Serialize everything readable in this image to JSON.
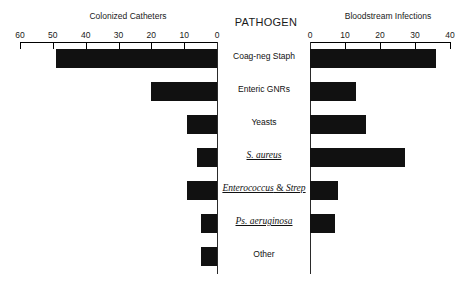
{
  "chart_data": {
    "type": "bar",
    "subtype": "back-to-back-tornado",
    "title": "",
    "center_header": "PATHOGEN",
    "categories": [
      "Coag-neg Staph",
      "Enteric GNRs",
      "Yeasts",
      "S. aureus",
      "Enterococcus & Strep",
      "Ps. aeruginosa",
      "Other"
    ],
    "series": [
      {
        "name": "Colonized Catheters",
        "side": "left",
        "values": [
          49,
          20,
          9,
          6,
          9,
          5,
          5
        ],
        "axis": {
          "label": "Colonized Catheters",
          "ticks": [
            60,
            50,
            40,
            30,
            20,
            10,
            0
          ],
          "min": 0,
          "max": 60,
          "direction": "reversed"
        }
      },
      {
        "name": "Bloodstream Infections",
        "side": "right",
        "values": [
          36,
          13,
          16,
          27,
          8,
          7,
          0
        ],
        "axis": {
          "label": "Bloodstream Infections",
          "ticks": [
            0,
            10,
            20,
            30,
            40
          ],
          "min": 0,
          "max": 40,
          "direction": "normal"
        }
      }
    ],
    "xlabel": "",
    "ylabel": "",
    "grid": false,
    "legend": "none",
    "bar_color": "#111111",
    "underlined_categories": [
      "S. aureus",
      "Enterococcus & Strep",
      "Ps. aeruginosa"
    ]
  }
}
